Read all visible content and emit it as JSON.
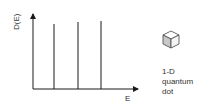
{
  "diagram": {
    "y_axis_label": "D(E)",
    "x_axis_label": "E",
    "delta_peaks": [
      {
        "x": 54,
        "top": 24
      },
      {
        "x": 78,
        "top": 22
      },
      {
        "x": 101,
        "top": 21
      }
    ],
    "icon": "cube-icon",
    "caption": [
      "1-D",
      "quantum",
      "dot"
    ],
    "colors": {
      "line": "#1a1a1a",
      "cube_shade": "#c8c8c8",
      "text": "#333333"
    }
  }
}
